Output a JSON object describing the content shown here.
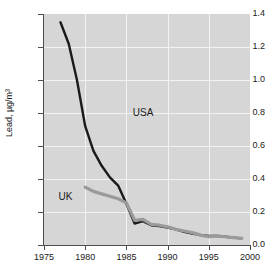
{
  "chart_data": {
    "type": "line",
    "title": "",
    "xlabel": "",
    "ylabel": "Lead, µg/m³",
    "xlim": [
      1975,
      2000
    ],
    "ylim": [
      0.0,
      1.4
    ],
    "xticks": [
      "1975",
      "1980",
      "1985",
      "1990",
      "1995",
      "2000"
    ],
    "yticks": [
      "0.0",
      "0.2",
      "0.4",
      "0.6",
      "0.8",
      "1.0",
      "1.2",
      "1.4"
    ],
    "grid": true,
    "legend_position": "inline-annotation",
    "plot_background": "#d6d6d6",
    "gridline_color": "#f2f2f2",
    "series": [
      {
        "name": "USA",
        "color": "#1a1a1a",
        "label_x": 1986.5,
        "label_y": 0.8,
        "x": [
          1977,
          1978,
          1979,
          1980,
          1981,
          1982,
          1983,
          1984,
          1985,
          1986,
          1987,
          1988,
          1989,
          1990,
          1991,
          1992,
          1993,
          1994,
          1995,
          1996,
          1997,
          1998,
          1999
        ],
        "y": [
          1.35,
          1.22,
          1.0,
          0.72,
          0.57,
          0.48,
          0.41,
          0.36,
          0.25,
          0.13,
          0.145,
          0.12,
          0.115,
          0.105,
          0.095,
          0.08,
          0.07,
          0.06,
          0.055,
          0.055,
          0.05,
          0.045,
          0.04
        ]
      },
      {
        "name": "UK",
        "color": "#9a9a9a",
        "label_x": 1977.5,
        "label_y": 0.29,
        "x": [
          1980,
          1981,
          1982,
          1983,
          1984,
          1985,
          1986,
          1987,
          1988,
          1989,
          1990,
          1991,
          1992,
          1993,
          1994,
          1995,
          1996,
          1997,
          1998,
          1999
        ],
        "y": [
          0.35,
          0.325,
          0.31,
          0.295,
          0.28,
          0.255,
          0.15,
          0.155,
          0.125,
          0.12,
          0.11,
          0.095,
          0.085,
          0.075,
          0.06,
          0.05,
          0.055,
          0.05,
          0.045,
          0.04
        ]
      }
    ]
  }
}
